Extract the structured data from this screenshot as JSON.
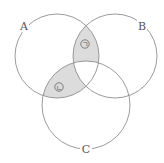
{
  "diagram": {
    "type": "venn",
    "sets": [
      {
        "id": "A",
        "label": "A"
      },
      {
        "id": "B",
        "label": "B"
      },
      {
        "id": "C",
        "label": "C"
      }
    ],
    "shaded_regions": [
      {
        "id": "region-1",
        "label": "ㄱ",
        "description": "A ∩ B − C"
      },
      {
        "id": "region-2",
        "label": "ㄴ",
        "description": "A ∩ C − B"
      }
    ],
    "colors": {
      "outline": "#8f8f8f",
      "shade": "#dcdcdc",
      "text": "#555555"
    }
  }
}
